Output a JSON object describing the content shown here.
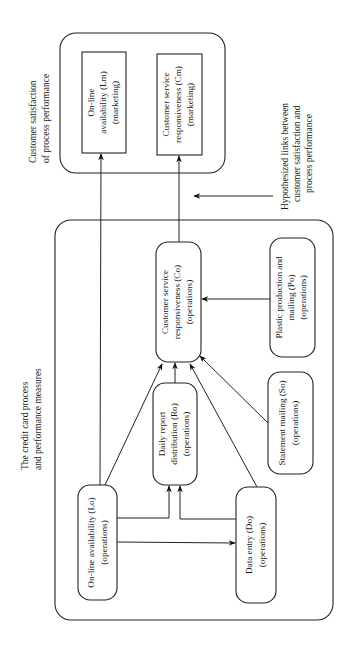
{
  "diagram": {
    "orientation": "rotated-90-ccw",
    "groups": {
      "marketing": {
        "label_line1": "Customer satisfaction",
        "label_line2": "of process performance"
      },
      "operations": {
        "label_line1": "The credit card process",
        "label_line2": "and performance measures"
      }
    },
    "annotation": {
      "line1": "Hypothesized links between",
      "line2": "customer satisfaction and",
      "line3": "process performance"
    },
    "nodes": {
      "Lm": {
        "line1": "On-line",
        "line2": "availability (Lm)",
        "line3": "(marketing)"
      },
      "Cm": {
        "line1": "Customer service",
        "line2": "responsiveness (Cm)",
        "line3": "(marketing)"
      },
      "Co": {
        "line1": "Customer service",
        "line2": "responsiveness (Co)",
        "line3": "(operations)"
      },
      "Po": {
        "line1": "Plastic production and",
        "line2": "mailing (Po)",
        "line3": "(operations)"
      },
      "Ro": {
        "line1": "Daily report",
        "line2": "distribution (Ro)",
        "line3": "(operations)"
      },
      "So": {
        "line1": "Statement mailing (So)",
        "line2": "(operations)"
      },
      "Lo": {
        "line1": "On-line availability (Lo)",
        "line2": "(operations)"
      },
      "Do": {
        "line1": "Data entry (Do)",
        "line2": "(operations)"
      }
    },
    "edges": [
      {
        "from": "Lo",
        "to": "Lm"
      },
      {
        "from": "Co",
        "to": "Cm"
      },
      {
        "from": "Po",
        "to": "Co"
      },
      {
        "from": "Ro",
        "to": "Co"
      },
      {
        "from": "So",
        "to": "Co"
      },
      {
        "from": "Lo",
        "to": "Co"
      },
      {
        "from": "Do",
        "to": "Co"
      },
      {
        "from": "Lo",
        "to": "Ro"
      },
      {
        "from": "Do",
        "to": "Ro"
      },
      {
        "from": "Lo",
        "to": "Do"
      }
    ]
  }
}
